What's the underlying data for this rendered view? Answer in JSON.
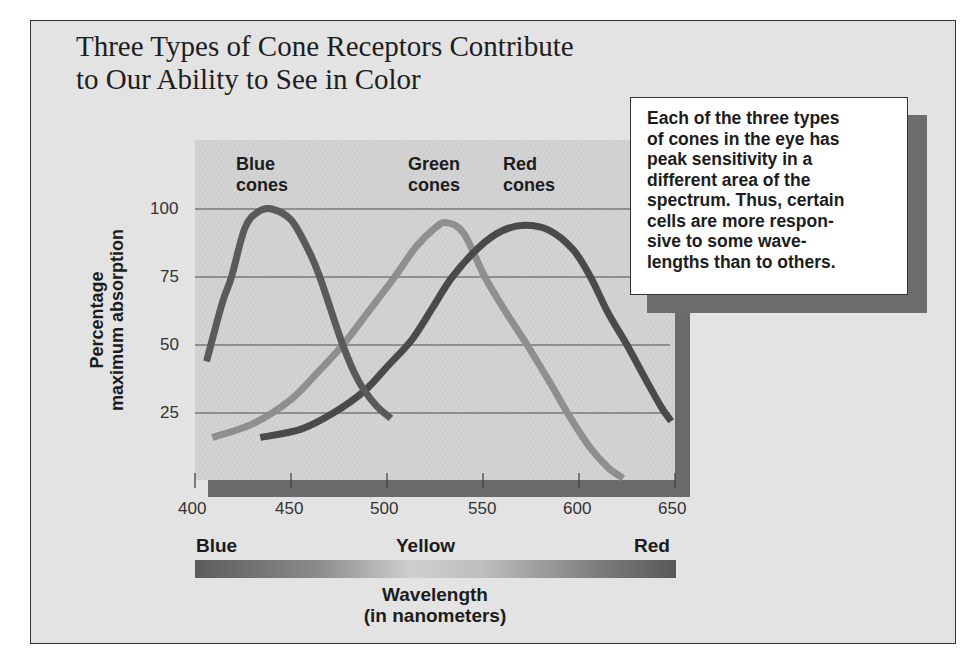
{
  "chart_data": {
    "type": "line",
    "title": "Three Types of Cone Receptors Contribute to Our Ability to See in Color",
    "title_lines": [
      "Three Types of Cone Receptors Contribute",
      "to Our Ability to See in Color"
    ],
    "xlabel": "Wavelength (in nanometers)",
    "xlabel_lines": [
      "Wavelength",
      "(in nanometers)"
    ],
    "ylabel": "Percentage maximum absorption",
    "ylabel_lines": [
      "Percentage",
      "maximum absorption"
    ],
    "xlim": [
      400,
      650
    ],
    "ylim": [
      0,
      100
    ],
    "x_ticks": [
      400,
      450,
      500,
      550,
      600,
      650
    ],
    "y_ticks": [
      25,
      50,
      75,
      100
    ],
    "grid": "horizontal",
    "legend": "inline labels above peaks",
    "series": [
      {
        "name": "Blue cones",
        "label_lines": [
          "Blue",
          "cones"
        ],
        "color": "#5a5a5a",
        "points": [
          [
            406,
            44
          ],
          [
            414,
            65
          ],
          [
            419,
            75
          ],
          [
            426,
            93
          ],
          [
            433,
            99
          ],
          [
            440,
            100
          ],
          [
            450,
            96
          ],
          [
            459,
            85
          ],
          [
            465,
            75
          ],
          [
            477,
            50
          ],
          [
            485,
            37
          ],
          [
            494,
            28
          ],
          [
            502,
            23
          ]
        ]
      },
      {
        "name": "Green cones",
        "label_lines": [
          "Green",
          "cones"
        ],
        "color": "#8f8f8f",
        "points": [
          [
            409,
            16
          ],
          [
            430,
            21
          ],
          [
            450,
            30
          ],
          [
            464,
            40
          ],
          [
            477,
            50
          ],
          [
            490,
            62
          ],
          [
            504,
            75
          ],
          [
            515,
            86
          ],
          [
            525,
            93
          ],
          [
            531,
            95
          ],
          [
            540,
            91
          ],
          [
            551,
            75
          ],
          [
            562,
            62
          ],
          [
            573,
            50
          ],
          [
            585,
            36
          ],
          [
            594,
            25
          ],
          [
            605,
            13
          ],
          [
            615,
            5
          ],
          [
            623,
            1
          ]
        ]
      },
      {
        "name": "Red cones",
        "label_lines": [
          "Red",
          "cones"
        ],
        "color": "#4a4a4a",
        "points": [
          [
            434,
            16
          ],
          [
            455,
            19
          ],
          [
            472,
            25
          ],
          [
            488,
            33
          ],
          [
            500,
            42
          ],
          [
            513,
            52
          ],
          [
            524,
            64
          ],
          [
            534,
            75
          ],
          [
            548,
            86
          ],
          [
            560,
            92
          ],
          [
            572,
            94
          ],
          [
            585,
            92
          ],
          [
            597,
            85
          ],
          [
            606,
            75
          ],
          [
            615,
            62
          ],
          [
            625,
            50
          ],
          [
            635,
            37
          ],
          [
            643,
            27
          ],
          [
            648,
            22
          ]
        ]
      }
    ],
    "spectrum_labels": [
      "Blue",
      "Yellow",
      "Red"
    ],
    "annotation": "Each of the three types of cones in the eye has peak sensitivity in a different area of the spectrum. Thus, certain cells are more responsive to some wavelengths than to others."
  },
  "note_lines": [
    "Each of the three types",
    "of cones in the eye has",
    "peak sensitivity in a",
    "different area of the",
    "spectrum. Thus, certain",
    "cells are more respon-",
    "sive to some wave-",
    "lengths than to others."
  ],
  "colors": {
    "frame_bg": "#e3e3e3",
    "plot_bg": "#cfcfcf",
    "axis_bar": "#6a6a6a"
  }
}
